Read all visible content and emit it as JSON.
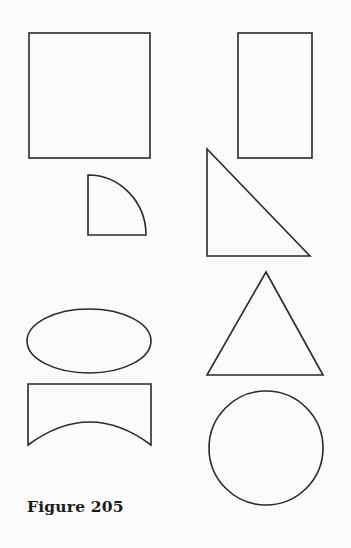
{
  "figure": {
    "caption": "Figure 205",
    "stroke_color": "#2a2a2a",
    "background": "#fbfbfa",
    "shapes": [
      {
        "name": "square"
      },
      {
        "name": "rectangle"
      },
      {
        "name": "quarter-circle"
      },
      {
        "name": "right-triangle"
      },
      {
        "name": "ellipse"
      },
      {
        "name": "equilateral-triangle"
      },
      {
        "name": "concave-arc-shape"
      },
      {
        "name": "circle"
      }
    ]
  }
}
